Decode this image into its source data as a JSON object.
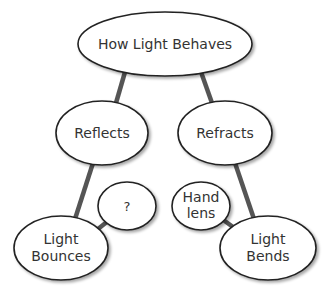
{
  "diagram": {
    "type": "concept-map",
    "colors": {
      "background": "#ffffff",
      "node_fill": "#ffffff",
      "node_stroke": "#222222",
      "edge": "#555555",
      "text": "#333333"
    },
    "nodes": [
      {
        "id": "root",
        "label": "How Light Behaves",
        "lines": [
          "How Light Behaves"
        ]
      },
      {
        "id": "reflects",
        "label": "Reflects",
        "lines": [
          "Reflects"
        ]
      },
      {
        "id": "refracts",
        "label": "Refracts",
        "lines": [
          "Refracts"
        ]
      },
      {
        "id": "question",
        "label": "?",
        "lines": [
          "?"
        ]
      },
      {
        "id": "handlens",
        "label": "Hand lens",
        "lines": [
          "Hand",
          "lens"
        ]
      },
      {
        "id": "bounces",
        "label": "Light Bounces",
        "lines": [
          "Light",
          "Bounces"
        ]
      },
      {
        "id": "bends",
        "label": "Light Bends",
        "lines": [
          "Light",
          "Bends"
        ]
      }
    ],
    "edges": [
      {
        "from": "root",
        "to": "reflects"
      },
      {
        "from": "root",
        "to": "refracts"
      },
      {
        "from": "reflects",
        "to": "bounces"
      },
      {
        "from": "refracts",
        "to": "bends"
      },
      {
        "from": "bounces",
        "to": "question"
      },
      {
        "from": "handlens",
        "to": "bends"
      }
    ]
  }
}
